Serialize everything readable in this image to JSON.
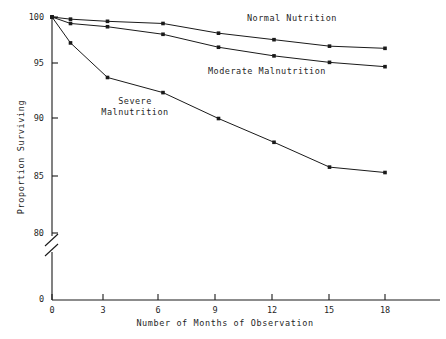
{
  "chart_data": {
    "type": "line",
    "title": "",
    "subtitle": "",
    "xlabel": "Number of Months of Observation",
    "ylabel": "Proportion Surviving",
    "x": [
      0,
      1,
      3,
      6,
      9,
      12,
      15,
      18
    ],
    "xticks": [
      0,
      3,
      6,
      9,
      12,
      15,
      18
    ],
    "xtick_labels": [
      "0",
      "3",
      "6",
      "9",
      "12",
      "15",
      "18"
    ],
    "xlim": [
      0,
      20
    ],
    "yticks": [
      80,
      85,
      90,
      95,
      100
    ],
    "ytick_labels": [
      "80",
      "85",
      "90",
      "95",
      "100"
    ],
    "ylim": [
      80,
      100
    ],
    "y_axis_break": true,
    "y_break_label": "0",
    "grid": false,
    "legend_position": "inline-annotations",
    "marker": "filled-square",
    "line_color": "#1a1a1a",
    "series": [
      {
        "name": "Normal Nutrition",
        "values": [
          100.0,
          99.8,
          99.6,
          99.4,
          98.5,
          97.9,
          97.3,
          97.1
        ],
        "label_x": 12.0,
        "label_y": 99.3
      },
      {
        "name": "Moderate Malnutrition",
        "values": [
          100.0,
          99.4,
          99.1,
          98.4,
          97.2,
          96.4,
          95.8,
          95.4
        ],
        "label_x": 11.0,
        "label_y": 96.6
      },
      {
        "name": "Severe Malnutrition",
        "values": [
          100.0,
          97.6,
          94.4,
          93.0,
          90.6,
          88.4,
          86.1,
          85.6
        ],
        "label_x": 5.0,
        "label_y": 91.6,
        "label_lines": [
          "Severe",
          "Malnutrition"
        ]
      }
    ]
  },
  "annotations": {
    "normal_nutrition": "Normal Nutrition",
    "moderate_malnutrition": "Moderate Malnutrition",
    "severe_line1": "Severe",
    "severe_line2": "Malnutrition"
  },
  "axes": {
    "y_title": "Proportion Surviving",
    "x_title": "Number of Months of Observation",
    "y_labels": [
      "100",
      "95",
      "90",
      "85",
      "80",
      "0"
    ],
    "x_labels": [
      "0",
      "3",
      "6",
      "9",
      "12",
      "15",
      "18"
    ],
    "x_origin_label": "0"
  }
}
